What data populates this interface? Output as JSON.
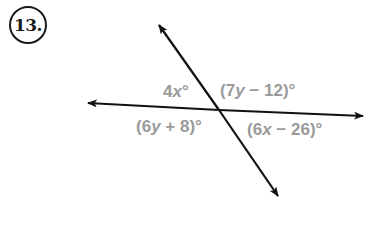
{
  "problem": {
    "number": "13."
  },
  "diagram": {
    "line_color": "#111111",
    "label_color": "#9a9a9a",
    "intersection": {
      "x": 219,
      "y": 110
    },
    "lines": [
      {
        "name": "transversal",
        "from": {
          "x": 158,
          "y": 24
        },
        "to": {
          "x": 279,
          "y": 197
        }
      },
      {
        "name": "horizontal",
        "from": {
          "x": 87,
          "y": 103
        },
        "to": {
          "x": 364,
          "y": 116
        }
      }
    ],
    "angles": {
      "top_left": {
        "coef": "4",
        "var": "x",
        "rest": "°"
      },
      "top_right": {
        "open": "(7",
        "var": "y",
        "rest": " − 12)°"
      },
      "bottom_left": {
        "open": "(6",
        "var": "y",
        "rest": " + 8)°"
      },
      "bottom_right": {
        "open": "(6",
        "var": "x",
        "rest": " − 26)°"
      }
    }
  }
}
